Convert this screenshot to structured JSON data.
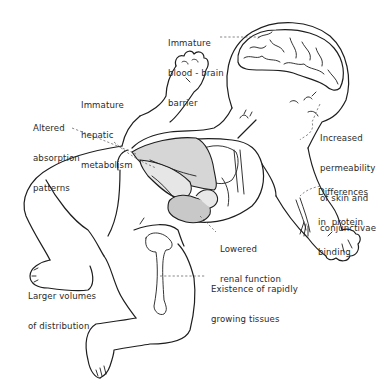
{
  "figure": {
    "style": "black-and-white line drawing",
    "colors": {
      "line": "#1e1e1e",
      "leader": "#555555",
      "organ_fill": "#d6d6d6",
      "kidney_fill": "#c8c8c8",
      "background": "#ffffff",
      "text": "#2a2a2a"
    }
  },
  "annotations": [
    {
      "id": "blood-brain",
      "lines": [
        "Immature",
        "blood - brain",
        "barrier"
      ],
      "target": "brain"
    },
    {
      "id": "hepatic",
      "lines": [
        "Immature",
        "hepatic",
        "metabolism"
      ],
      "target": "liver"
    },
    {
      "id": "absorption",
      "lines": [
        "Altered",
        "absorption",
        "patterns"
      ],
      "target": "gut"
    },
    {
      "id": "permeability",
      "lines": [
        "Increased",
        "permeability",
        "of skin and",
        "conjunctivae"
      ],
      "target": "face-skin"
    },
    {
      "id": "protein-binding",
      "lines": [
        "Differences",
        "in  protein",
        "binding"
      ],
      "target": "arm-vessels"
    },
    {
      "id": "renal",
      "lines": [
        "Lowered",
        "renal function"
      ],
      "target": "kidney"
    },
    {
      "id": "distribution",
      "lines": [
        "Larger volumes",
        "of distribution"
      ],
      "target": "body"
    },
    {
      "id": "growing-tissues",
      "lines": [
        "Existence of rapidly",
        "growing tissues"
      ],
      "target": "femur"
    }
  ]
}
